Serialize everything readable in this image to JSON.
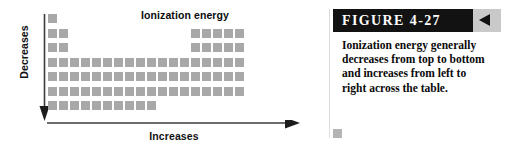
{
  "figure": {
    "header_label": "FIGURE 4-27",
    "arrow_icon": "triangle-left-icon",
    "caption": "Ionization energy generally decreases from top to bottom and increases from left to right across the table.",
    "header_bg": "#121212",
    "header_text_color": "#ffffff",
    "band_bg": "#c9c9c9"
  },
  "diagram": {
    "title": "Ionization energy",
    "y_axis": {
      "label": "Decreases",
      "direction": "down",
      "arrow_icon": "arrow-down-icon"
    },
    "x_axis": {
      "label": "Increases",
      "direction": "right",
      "arrow_icon": "arrow-right-icon"
    },
    "cell_color": "#a8a8a8",
    "axis_color": "#3c3c3c"
  },
  "chart_data": {
    "type": "heatmap",
    "title": "Ionization energy",
    "xlabel": "Increases",
    "ylabel": "Decreases",
    "grid": false,
    "legend": "none",
    "columns": 18,
    "rows": 7,
    "cell_size_px": 9,
    "cell_pitch_px": 11,
    "annotations": [
      "Decreases (top to bottom)",
      "Increases (left to right)"
    ],
    "occupied_cells": [
      {
        "row": 1,
        "cols": [
          1
        ]
      },
      {
        "row": 2,
        "cols": [
          1,
          2,
          14,
          15,
          16,
          17,
          18
        ]
      },
      {
        "row": 3,
        "cols": [
          1,
          2,
          14,
          15,
          16,
          17,
          18
        ]
      },
      {
        "row": 4,
        "cols": [
          1,
          2,
          3,
          4,
          5,
          6,
          7,
          8,
          9,
          10,
          11,
          12,
          13,
          14,
          15,
          16,
          17,
          18
        ]
      },
      {
        "row": 5,
        "cols": [
          1,
          2,
          3,
          4,
          5,
          6,
          7,
          8,
          9,
          10,
          11,
          12,
          13,
          14,
          15,
          16,
          17,
          18
        ]
      },
      {
        "row": 6,
        "cols": [
          1,
          2,
          3,
          4,
          5,
          6,
          7,
          8,
          9,
          10,
          11,
          12,
          13,
          14,
          15,
          16,
          17,
          18
        ]
      },
      {
        "row": 7,
        "cols": [
          1,
          2,
          3,
          4,
          5,
          6,
          7,
          8,
          9,
          10
        ]
      }
    ]
  }
}
